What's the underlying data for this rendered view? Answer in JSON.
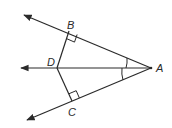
{
  "diagram": {
    "type": "geometry",
    "points": {
      "A": {
        "label": "A",
        "x": 151,
        "y": 68
      },
      "B": {
        "label": "B",
        "x": 69,
        "y": 31
      },
      "C": {
        "label": "C",
        "x": 72,
        "y": 101
      },
      "D": {
        "label": "D",
        "x": 57,
        "y": 68
      }
    },
    "rays": [
      {
        "name": "ray-AB",
        "from": "A",
        "through": "B"
      },
      {
        "name": "ray-AD",
        "from": "A",
        "through": "D"
      },
      {
        "name": "ray-AC",
        "from": "A",
        "through": "C"
      }
    ],
    "segments": [
      {
        "name": "segment-DB",
        "from": "D",
        "to": "B"
      },
      {
        "name": "segment-DC",
        "from": "D",
        "to": "C"
      }
    ],
    "right_angles": [
      "B",
      "C"
    ],
    "congruent_angles": [
      "BAD",
      "CAD"
    ],
    "colors": {
      "stroke": "#2a2a2a",
      "background": "#ffffff"
    }
  }
}
